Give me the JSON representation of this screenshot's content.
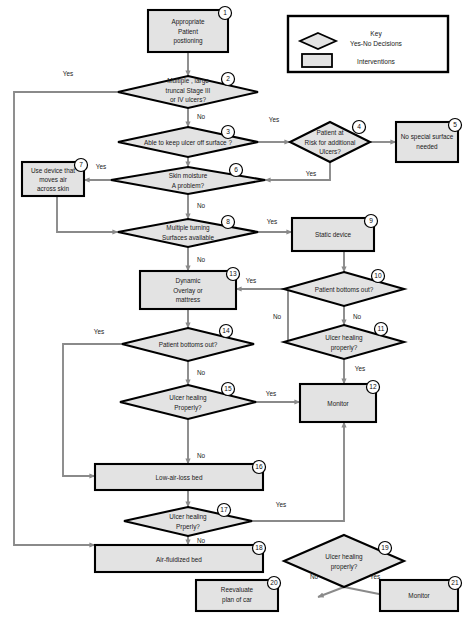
{
  "diagram": {
    "colors": {
      "shape_fill": "#e3e3e3",
      "shape_stroke": "#000000",
      "connector": "#8a8a8a",
      "background": "#ffffff"
    },
    "legend": {
      "title": "Key",
      "decision_label": "Yes-No Decisions",
      "intervention_label": "Interventions"
    },
    "edge_labels": {
      "yes": "Yes",
      "no": "No"
    },
    "nodes": [
      {
        "num": "1",
        "type": "process",
        "lines": [
          "Appropriate",
          "Patient",
          "postioning"
        ]
      },
      {
        "num": "2",
        "type": "decision",
        "lines": [
          "Multiple , large",
          "truncal Stage III",
          "or IV ulcers?"
        ]
      },
      {
        "num": "3",
        "type": "decision",
        "lines": [
          "Able to keep ulcer  off surface ?"
        ]
      },
      {
        "num": "4",
        "type": "decision",
        "lines": [
          "Patient at",
          "Risk for additional",
          "Ulcers?"
        ]
      },
      {
        "num": "5",
        "type": "process",
        "lines": [
          "No special surface",
          "needed"
        ]
      },
      {
        "num": "6",
        "type": "decision",
        "lines": [
          "Skin moisture",
          "A problem?"
        ]
      },
      {
        "num": "7",
        "type": "process",
        "lines": [
          "Use device that",
          "moves air",
          "across skin"
        ]
      },
      {
        "num": "8",
        "type": "decision",
        "lines": [
          "Multiple turning",
          "Surfaces available"
        ]
      },
      {
        "num": "9",
        "type": "process",
        "lines": [
          "Static device"
        ]
      },
      {
        "num": "10",
        "type": "decision",
        "lines": [
          "Patient bottoms out?"
        ]
      },
      {
        "num": "11",
        "type": "decision",
        "lines": [
          "Ulcer healing",
          "properly?"
        ]
      },
      {
        "num": "12",
        "type": "process",
        "lines": [
          "Monitor"
        ]
      },
      {
        "num": "13",
        "type": "process",
        "lines": [
          "Dynamic",
          "Overlay or",
          "mattress"
        ]
      },
      {
        "num": "14",
        "type": "decision",
        "lines": [
          "Patient bottoms out?"
        ]
      },
      {
        "num": "15",
        "type": "decision",
        "lines": [
          "Ulcer healing",
          "Properly?"
        ]
      },
      {
        "num": "16",
        "type": "process",
        "lines": [
          "Low-air-loss bed"
        ]
      },
      {
        "num": "17",
        "type": "decision",
        "lines": [
          "Ulcer healing",
          "Prperly?"
        ]
      },
      {
        "num": "18",
        "type": "process",
        "lines": [
          "Air-fluidized bed"
        ]
      },
      {
        "num": "19",
        "type": "decision",
        "lines": [
          "Ulcer healing",
          "properly?"
        ]
      },
      {
        "num": "20",
        "type": "process",
        "lines": [
          "Reevaluate",
          "plan of car"
        ]
      },
      {
        "num": "21",
        "type": "process",
        "lines": [
          "Monitor"
        ]
      }
    ],
    "edges": [
      {
        "from": "1",
        "to": "2",
        "label": ""
      },
      {
        "from": "2",
        "to": "18",
        "label": "Yes"
      },
      {
        "from": "2",
        "to": "3",
        "label": "No"
      },
      {
        "from": "3",
        "to": "4",
        "label": "Yes"
      },
      {
        "from": "3",
        "to": "6",
        "label": ""
      },
      {
        "from": "4",
        "to": "5",
        "label": ""
      },
      {
        "from": "4",
        "to": "6",
        "label": "Yes"
      },
      {
        "from": "6",
        "to": "7",
        "label": "Yes"
      },
      {
        "from": "6",
        "to": "8",
        "label": "No"
      },
      {
        "from": "7",
        "to": "8",
        "label": ""
      },
      {
        "from": "8",
        "to": "9",
        "label": "Yes"
      },
      {
        "from": "8",
        "to": "13",
        "label": "No"
      },
      {
        "from": "9",
        "to": "10",
        "label": ""
      },
      {
        "from": "10",
        "to": "13",
        "label": "Yes"
      },
      {
        "from": "10",
        "to": "11",
        "label": "No"
      },
      {
        "from": "11",
        "to": "13",
        "label": "No"
      },
      {
        "from": "11",
        "to": "12",
        "label": "Yes"
      },
      {
        "from": "13",
        "to": "14",
        "label": ""
      },
      {
        "from": "14",
        "to": "16",
        "label": "Yes"
      },
      {
        "from": "14",
        "to": "15",
        "label": "No"
      },
      {
        "from": "15",
        "to": "12",
        "label": "Yes"
      },
      {
        "from": "15",
        "to": "16",
        "label": "No"
      },
      {
        "from": "16",
        "to": "17",
        "label": ""
      },
      {
        "from": "17",
        "to": "12",
        "label": "Yes"
      },
      {
        "from": "17",
        "to": "18",
        "label": "No"
      },
      {
        "from": "19",
        "to": "20",
        "label": "No"
      },
      {
        "from": "19",
        "to": "21",
        "label": "Yes"
      }
    ]
  }
}
